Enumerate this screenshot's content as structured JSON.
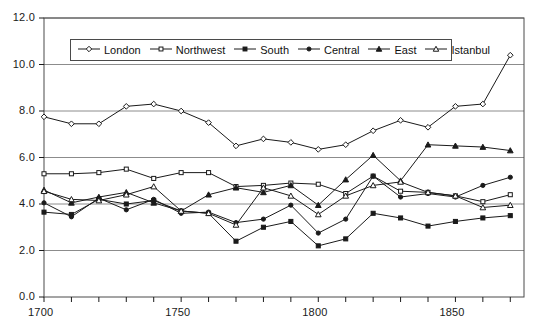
{
  "chart_data": {
    "type": "line",
    "title": "",
    "xlabel": "",
    "ylabel": "",
    "xlim": [
      1700,
      1875
    ],
    "ylim": [
      0.0,
      12.0
    ],
    "grid": true,
    "legend_position": "top-inside",
    "x_ticks_major": [
      1700,
      1750,
      1800,
      1850
    ],
    "x_tick_labels": [
      "1700",
      "1750",
      "1800",
      "1850"
    ],
    "x_tick_step_minor": 10,
    "y_ticks": [
      0.0,
      2.0,
      4.0,
      6.0,
      8.0,
      10.0,
      12.0
    ],
    "y_tick_labels": [
      "0.0",
      "2.0",
      "4.0",
      "6.0",
      "8.0",
      "10.0",
      "12.0"
    ],
    "x": [
      1700,
      1710,
      1720,
      1730,
      1740,
      1750,
      1760,
      1770,
      1780,
      1790,
      1800,
      1810,
      1820,
      1830,
      1840,
      1850,
      1860,
      1870
    ],
    "series": [
      {
        "name": "London",
        "marker": "open-diamond",
        "values": [
          7.75,
          7.45,
          7.45,
          8.2,
          8.3,
          8.0,
          7.5,
          6.5,
          6.8,
          6.65,
          6.35,
          6.55,
          7.15,
          7.6,
          7.3,
          8.2,
          8.3,
          10.4
        ]
      },
      {
        "name": "Northwest",
        "marker": "open-square",
        "values": [
          5.3,
          5.3,
          5.35,
          5.5,
          5.1,
          5.35,
          5.35,
          4.75,
          4.8,
          4.9,
          4.85,
          4.45,
          5.2,
          4.55,
          4.5,
          4.35,
          4.1,
          4.4
        ]
      },
      {
        "name": "South",
        "marker": "filled-square",
        "values": [
          3.65,
          3.55,
          4.2,
          4.0,
          4.15,
          3.7,
          3.6,
          2.4,
          3.0,
          3.25,
          2.2,
          2.5,
          3.6,
          3.4,
          3.05,
          3.25,
          3.4,
          3.5
        ]
      },
      {
        "name": "Central",
        "marker": "filled-circle",
        "values": [
          4.05,
          3.45,
          4.25,
          3.75,
          4.2,
          3.6,
          3.65,
          3.2,
          3.35,
          3.95,
          2.75,
          3.35,
          5.2,
          4.3,
          4.45,
          4.3,
          4.8,
          5.15
        ]
      },
      {
        "name": "East",
        "marker": "filled-triangle",
        "values": [
          4.6,
          4.05,
          4.3,
          4.5,
          4.05,
          3.7,
          4.4,
          4.7,
          4.5,
          4.8,
          3.95,
          5.05,
          6.1,
          5.0,
          6.55,
          6.5,
          6.45,
          6.3
        ]
      },
      {
        "name": "Istanbul",
        "marker": "open-triangle",
        "values": [
          4.55,
          4.2,
          4.15,
          4.4,
          4.75,
          3.7,
          3.6,
          3.1,
          4.7,
          4.35,
          3.55,
          4.35,
          4.8,
          4.95,
          4.5,
          4.35,
          3.85,
          3.95
        ]
      }
    ]
  },
  "legend": {
    "items": [
      {
        "label": "London",
        "marker": "open-diamond"
      },
      {
        "label": "Northwest",
        "marker": "open-square"
      },
      {
        "label": "South",
        "marker": "filled-square"
      },
      {
        "label": "Central",
        "marker": "filled-circle"
      },
      {
        "label": "East",
        "marker": "filled-triangle"
      },
      {
        "label": "Istanbul",
        "marker": "open-triangle"
      }
    ]
  },
  "colors": {
    "line": "#1a1a1a",
    "grid": "#8c8c8c",
    "axis": "#4a4a4a",
    "background": "#ffffff",
    "marker_fill_open": "#ffffff"
  }
}
